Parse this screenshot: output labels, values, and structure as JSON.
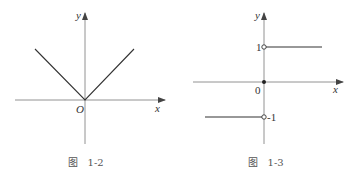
{
  "figures": [
    {
      "id": "fig-1-2",
      "caption": "图   1-2",
      "axis_labels": {
        "x": "x",
        "y": "y",
        "origin": "O"
      },
      "function": "y = |x|"
    },
    {
      "id": "fig-1-3",
      "caption": "图   1-3",
      "axis_labels": {
        "x": "x",
        "y": "y",
        "origin": "0"
      },
      "ticks": {
        "upper": "1",
        "lower": "-1"
      },
      "function": "y = sgn x"
    }
  ],
  "colors": {
    "axis": "#555555",
    "curve": "#333333",
    "background": "#ffffff"
  }
}
